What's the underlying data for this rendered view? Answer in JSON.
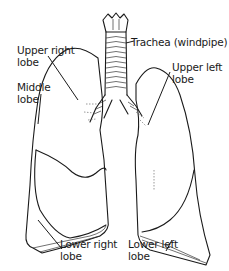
{
  "figure": {
    "colors": {
      "ink": "#1a1a1a",
      "background": "#ffffff"
    },
    "labels": {
      "trachea": "Trachea (windpipe)",
      "upper_right": [
        "Upper right",
        "lobe"
      ],
      "middle": [
        "Middle",
        "lobe"
      ],
      "lower_right": [
        "Lower right",
        "lobe"
      ],
      "upper_left": [
        "Upper left",
        "lobe"
      ],
      "lower_left": [
        "Lower left",
        "lobe"
      ]
    }
  }
}
